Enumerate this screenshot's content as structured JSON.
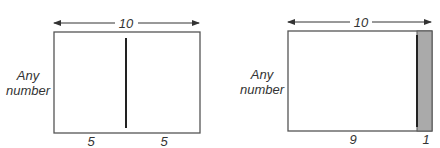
{
  "diagrams": [
    {
      "top_label": "10",
      "side_label_line1": "Any",
      "side_label_line2": "number",
      "bottom_labels": [
        "5",
        "5"
      ],
      "split": "equal halves"
    },
    {
      "top_label": "10",
      "side_label_line1": "Any",
      "side_label_line2": "number",
      "bottom_labels": [
        "9",
        "1"
      ],
      "split": "9 and 1, narrow part shaded"
    }
  ],
  "colors": {
    "line": "#333333",
    "shade": "#aaaaaa",
    "background": "#ffffff"
  }
}
